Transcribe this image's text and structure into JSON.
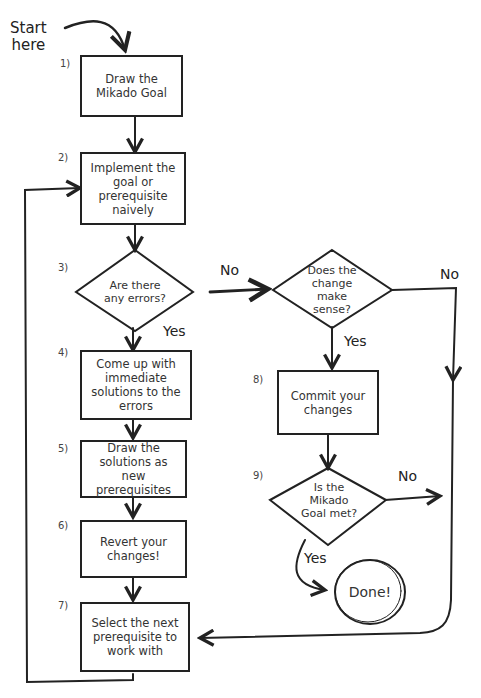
{
  "diagram": {
    "type": "flowchart",
    "start_label": [
      "Start",
      "here"
    ],
    "nodes": [
      {
        "id": "1",
        "number": "1)",
        "shape": "rectangle",
        "text": "Draw the Mikado Goal"
      },
      {
        "id": "2",
        "number": "2)",
        "shape": "rectangle",
        "text": "Implement the goal or prerequisite naively"
      },
      {
        "id": "3",
        "number": "3)",
        "shape": "diamond",
        "text": "Are there any errors?"
      },
      {
        "id": "3b",
        "number": "",
        "shape": "diamond",
        "text": "Does the change make sense?"
      },
      {
        "id": "4",
        "number": "4)",
        "shape": "rectangle",
        "text": "Come up with immediate solutions to the errors"
      },
      {
        "id": "5",
        "number": "5)",
        "shape": "rectangle",
        "text": "Draw the solutions as new prerequisites"
      },
      {
        "id": "6",
        "number": "6)",
        "shape": "rectangle",
        "text": "Revert your changes!"
      },
      {
        "id": "7",
        "number": "7)",
        "shape": "rectangle",
        "text": "Select the next prerequisite to work with"
      },
      {
        "id": "8",
        "number": "8)",
        "shape": "rectangle",
        "text": "Commit your changes"
      },
      {
        "id": "9",
        "number": "9)",
        "shape": "diamond",
        "text": "Is the Mikado Goal met?"
      },
      {
        "id": "done",
        "number": "",
        "shape": "circle",
        "text": "Done!"
      }
    ],
    "edges": [
      {
        "from": "start",
        "to": "1",
        "label": ""
      },
      {
        "from": "1",
        "to": "2",
        "label": ""
      },
      {
        "from": "2",
        "to": "3",
        "label": ""
      },
      {
        "from": "3",
        "to": "3b",
        "label": "No"
      },
      {
        "from": "3",
        "to": "4",
        "label": "Yes"
      },
      {
        "from": "3b",
        "to": "8",
        "label": "Yes"
      },
      {
        "from": "3b",
        "to": "7",
        "label": "No"
      },
      {
        "from": "4",
        "to": "5",
        "label": ""
      },
      {
        "from": "5",
        "to": "6",
        "label": ""
      },
      {
        "from": "6",
        "to": "7",
        "label": ""
      },
      {
        "from": "7",
        "to": "2",
        "label": ""
      },
      {
        "from": "8",
        "to": "9",
        "label": ""
      },
      {
        "from": "9",
        "to": "done",
        "label": "Yes"
      },
      {
        "from": "9",
        "to": "7",
        "label": "No"
      }
    ],
    "edge_labels": {
      "no_1": "No",
      "yes_1": "Yes",
      "no_2": "No",
      "yes_2": "Yes",
      "no_3": "No",
      "yes_3": "Yes"
    }
  }
}
